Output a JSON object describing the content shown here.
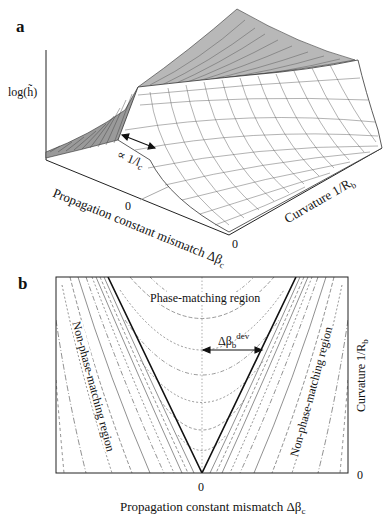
{
  "figure": {
    "panel_a": {
      "letter": "a",
      "z_label": "log(h̃)",
      "annotation": "∝ 1/l",
      "annotation_sub": "c",
      "x_axis_label": "Propagation constant mismatch Δβ",
      "x_axis_sub": "c",
      "x_zero": "0",
      "y_axis_label": "Curvature 1/R",
      "y_axis_sub": "b",
      "y_zero": "0"
    },
    "panel_b": {
      "letter": "b",
      "region_top": "Phase-matching region",
      "region_left": "Non-phase-matching region",
      "region_right": "Non-phase-matching region",
      "dev_label": "Δβ",
      "dev_sub": "b",
      "dev_sup": "dev",
      "x_axis_label": "Propagation constant mismatch Δβ",
      "x_axis_sub": "c",
      "x_zero": "0",
      "y_axis_label": "Curvature 1/R",
      "y_axis_sub": "b",
      "y_zero": "0"
    }
  },
  "colors": {
    "line": "#222222",
    "grid": "#555555",
    "background": "#ffffff"
  }
}
